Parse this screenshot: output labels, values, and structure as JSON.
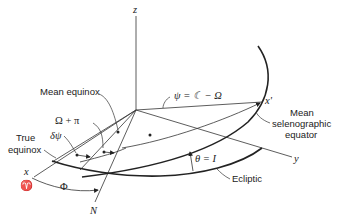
{
  "diagram": {
    "axes": {
      "z": "z",
      "x_prime": "x'",
      "y": "y",
      "x": "x",
      "aries": "♈",
      "node": "N"
    },
    "labels": {
      "mean_equinox": "Mean equinox",
      "true_equinox_line1": "True",
      "true_equinox_line2": "equinox",
      "mean_selenographic_line1": "Mean",
      "mean_selenographic_line2": "selenographic",
      "mean_selenographic_line3": "equator",
      "ecliptic": "Ecliptic"
    },
    "angles": {
      "psi": "ψ = ☾ − Ω",
      "omega_plus_pi": "Ω + π",
      "delta_psi": "δψ",
      "phi": "Φ",
      "theta": "θ = I"
    },
    "colors": {
      "ink": "#222222",
      "background": "#ffffff"
    }
  }
}
